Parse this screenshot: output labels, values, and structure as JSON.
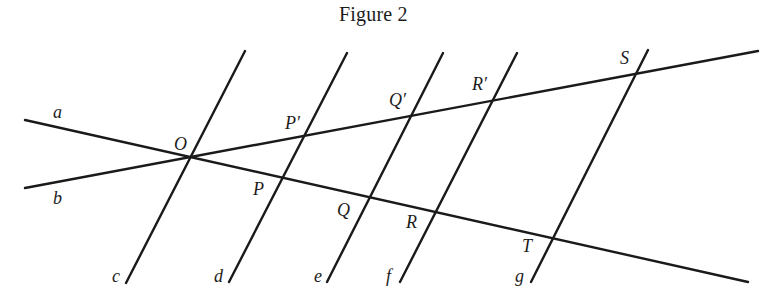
{
  "figure": {
    "title": "Figure 2",
    "ink_color": "#1a1a1a",
    "lines": {
      "a": {
        "label": "a",
        "from": [
          25,
          120
        ],
        "to": [
          748,
          282
        ],
        "desc": "line a through O, P, Q, R, T"
      },
      "b": {
        "label": "b",
        "from": [
          25,
          188
        ],
        "to": [
          758,
          51
        ],
        "desc": "line b through O, P', Q', R', S"
      },
      "c": {
        "label": "c",
        "from": [
          126,
          283
        ],
        "to": [
          245,
          51
        ]
      },
      "d": {
        "label": "d",
        "from": [
          229,
          282
        ],
        "to": [
          347,
          53
        ]
      },
      "e": {
        "label": "e",
        "from": [
          327,
          282
        ],
        "to": [
          443,
          53
        ]
      },
      "f": {
        "label": "f",
        "from": [
          400,
          282
        ],
        "to": [
          517,
          53
        ]
      },
      "g": {
        "label": "g",
        "from": [
          531,
          282
        ],
        "to": [
          648,
          50
        ]
      }
    },
    "points": {
      "O": {
        "label": "O"
      },
      "P": {
        "label": "P"
      },
      "P_prime": {
        "label": "P′"
      },
      "Q": {
        "label": "Q"
      },
      "Q_prime": {
        "label": "Q′"
      },
      "R": {
        "label": "R"
      },
      "R_prime": {
        "label": "R′"
      },
      "S": {
        "label": "S"
      },
      "T": {
        "label": "T"
      }
    }
  }
}
